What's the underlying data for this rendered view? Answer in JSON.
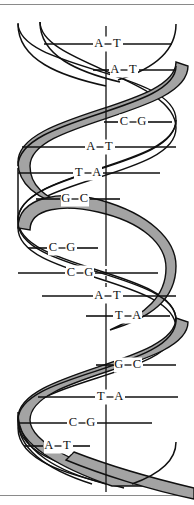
{
  "figure": {
    "width": 194,
    "height": 505
  },
  "colors": {
    "background": "#ffffff",
    "ink": "#101010",
    "ribbon_fill": "#a3a3a3",
    "ribbon_fill_shadow": "#8f8f8f",
    "frame": "#8a8a8a"
  },
  "axis": {
    "label": "helix-axis",
    "x": 106,
    "top_y": 26,
    "bottom_y": 492
  },
  "base_pairs": [
    {
      "index": 1,
      "left": "A",
      "right": "T",
      "pair": "A–T",
      "label_x": 108,
      "label_y": 44,
      "rung_x1": 44,
      "rung_x2": 172,
      "dash": false
    },
    {
      "index": 2,
      "left": "A",
      "right": "T",
      "pair": "A–T",
      "label_x": 124,
      "label_y": 70,
      "rung_x1": 93,
      "rung_x2": 176,
      "dash": false
    },
    {
      "index": 3,
      "left": "C",
      "right": "G",
      "pair": "C–G",
      "label_x": 133,
      "label_y": 122,
      "rung_x1": 104,
      "rung_x2": 172,
      "dash": false
    },
    {
      "index": 4,
      "left": "A",
      "right": "T",
      "pair": "A–T",
      "label_x": 100,
      "label_y": 147,
      "rung_x1": 22,
      "rung_x2": 176,
      "dash": false
    },
    {
      "index": 5,
      "left": "T",
      "right": "A",
      "pair": "T–A",
      "label_x": 88,
      "label_y": 173,
      "rung_x1": 18,
      "rung_x2": 160,
      "dash": false
    },
    {
      "index": 6,
      "left": "G",
      "right": "C",
      "pair": "G–C",
      "label_x": 75,
      "label_y": 199,
      "rung_x1": 36,
      "rung_x2": 120,
      "dash": false
    },
    {
      "index": 7,
      "left": "C",
      "right": "G",
      "pair": "C–G",
      "label_x": 62,
      "label_y": 248,
      "rung_x1": 28,
      "rung_x2": 98,
      "dash": false
    },
    {
      "index": 8,
      "left": "C",
      "right": "G",
      "pair": "C–G",
      "label_x": 80,
      "label_y": 273,
      "rung_x1": 18,
      "rung_x2": 158,
      "dash": false
    },
    {
      "index": 9,
      "left": "A",
      "right": "T",
      "pair": "A–T",
      "label_x": 108,
      "label_y": 296,
      "rung_x1": 42,
      "rung_x2": 176,
      "dash": false
    },
    {
      "index": 10,
      "left": "T",
      "right": "A",
      "pair": "T–A",
      "label_x": 128,
      "label_y": 316,
      "rung_x1": 86,
      "rung_x2": 170,
      "dash": false
    },
    {
      "index": 11,
      "left": "G",
      "right": "C",
      "pair": "G–C",
      "label_x": 128,
      "label_y": 365,
      "rung_x1": 96,
      "rung_x2": 176,
      "dash": false
    },
    {
      "index": 12,
      "left": "T",
      "right": "A",
      "pair": "T–A",
      "label_x": 110,
      "label_y": 397,
      "rung_x1": 38,
      "rung_x2": 178,
      "dash": false
    },
    {
      "index": 13,
      "left": "C",
      "right": "G",
      "pair": "C–G",
      "label_x": 82,
      "label_y": 423,
      "rung_x1": 18,
      "rung_x2": 152,
      "dash": false
    },
    {
      "index": 14,
      "left": "A",
      "right": "T",
      "pair": "A–T",
      "label_x": 58,
      "label_y": 446,
      "rung_x1": 24,
      "rung_x2": 90,
      "dash": false
    }
  ],
  "legend": {
    "ribbon_name": "shaded-backbone-ribbon",
    "strand_name": "outline-backbone-strand",
    "rung_name": "base-pair-rung"
  }
}
